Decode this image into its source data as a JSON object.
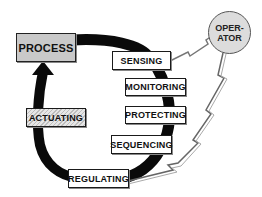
{
  "diagram": {
    "type": "control loop",
    "nodes": {
      "process": "PROCESS",
      "sensing": "SENSING",
      "monitoring": "MONITORING",
      "protecting": "PROTECTING",
      "sequencing": "SEQUENCING",
      "regulating": "REGULATING",
      "actuating": "ACTUATING",
      "operator_line1": "OPER-",
      "operator_line2": "ATOR"
    },
    "edges": [
      {
        "from": "PROCESS",
        "to": "SENSING"
      },
      {
        "from": "SENSING",
        "to": "REGULATING",
        "via": [
          "MONITORING",
          "PROTECTING",
          "SEQUENCING"
        ]
      },
      {
        "from": "REGULATING",
        "to": "PROCESS",
        "via": [
          "ACTUATING"
        ]
      },
      {
        "from": "OPERATOR",
        "to": "SENSING",
        "style": "lightning"
      },
      {
        "from": "OPERATOR",
        "to": "REGULATING",
        "style": "lightning"
      }
    ],
    "colors": {
      "loop": "#0a0a0a",
      "process_fill": "#c9c9c9",
      "operator_fill": "#dcdcdc"
    }
  }
}
